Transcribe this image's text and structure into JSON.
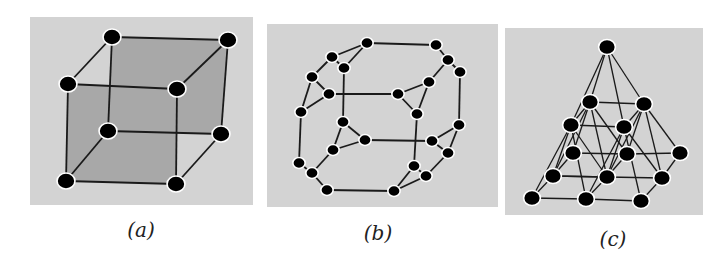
{
  "figure": {
    "panels": [
      {
        "id": "a",
        "label": "(a)",
        "description": "Cube graph (8 vertices, 12 edges)",
        "box": {
          "x": 30,
          "y": 17,
          "w": 223,
          "h": 188
        },
        "label_pos": {
          "x": 141,
          "y": 237
        },
        "nodes": [
          [
            112,
            37
          ],
          [
            228,
            40
          ],
          [
            68,
            84
          ],
          [
            177,
            89
          ],
          [
            108,
            131
          ],
          [
            221,
            134
          ],
          [
            66,
            181
          ],
          [
            176,
            184
          ]
        ],
        "edges": [
          [
            0,
            1
          ],
          [
            0,
            2
          ],
          [
            1,
            3
          ],
          [
            2,
            3
          ],
          [
            0,
            4
          ],
          [
            1,
            5
          ],
          [
            4,
            5
          ],
          [
            2,
            6
          ],
          [
            3,
            7
          ],
          [
            6,
            7
          ],
          [
            4,
            6
          ],
          [
            5,
            7
          ]
        ],
        "shaded_faces": [
          [
            0,
            1,
            5,
            4
          ],
          [
            2,
            3,
            7,
            6
          ]
        ]
      },
      {
        "id": "b",
        "label": "(b)",
        "description": "Truncated cube graph (24 vertices)",
        "box": {
          "x": 267,
          "y": 24,
          "w": 231,
          "h": 183
        },
        "label_pos": {
          "x": 378,
          "y": 240
        },
        "nodes": [
          [
            367,
            43
          ],
          [
            332,
            57
          ],
          [
            344,
            68
          ],
          [
            312,
            77
          ],
          [
            329,
            94
          ],
          [
            301,
            112
          ],
          [
            436,
            45
          ],
          [
            448,
            60
          ],
          [
            460,
            72
          ],
          [
            429,
            82
          ],
          [
            398,
            94
          ],
          [
            417,
            114
          ],
          [
            343,
            122
          ],
          [
            365,
            140
          ],
          [
            333,
            150
          ],
          [
            299,
            163
          ],
          [
            312,
            173
          ],
          [
            327,
            190
          ],
          [
            459,
            125
          ],
          [
            432,
            141
          ],
          [
            448,
            153
          ],
          [
            414,
            166
          ],
          [
            426,
            176
          ],
          [
            394,
            191
          ]
        ],
        "edges": [
          [
            0,
            1
          ],
          [
            1,
            2
          ],
          [
            0,
            2
          ],
          [
            0,
            6
          ],
          [
            1,
            3
          ],
          [
            3,
            4
          ],
          [
            3,
            5
          ],
          [
            4,
            5
          ],
          [
            2,
            12
          ],
          [
            4,
            10
          ],
          [
            6,
            7
          ],
          [
            7,
            8
          ],
          [
            7,
            9
          ],
          [
            9,
            10
          ],
          [
            9,
            11
          ],
          [
            10,
            11
          ],
          [
            8,
            18
          ],
          [
            11,
            21
          ],
          [
            5,
            15
          ],
          [
            12,
            13
          ],
          [
            12,
            14
          ],
          [
            13,
            14
          ],
          [
            13,
            19
          ],
          [
            14,
            16
          ],
          [
            15,
            16
          ],
          [
            16,
            17
          ],
          [
            17,
            23
          ],
          [
            18,
            19
          ],
          [
            18,
            20
          ],
          [
            19,
            20
          ],
          [
            20,
            22
          ],
          [
            21,
            22
          ],
          [
            21,
            23
          ],
          [
            22,
            23
          ]
        ]
      },
      {
        "id": "c",
        "label": "(c)",
        "description": "Subdivided square pyramid (14 vertices)",
        "box": {
          "x": 505,
          "y": 28,
          "w": 198,
          "h": 187
        },
        "label_pos": {
          "x": 613,
          "y": 246
        },
        "nodes": [
          [
            607,
            47
          ],
          [
            590,
            102
          ],
          [
            644,
            104
          ],
          [
            571,
            125
          ],
          [
            624,
            127
          ],
          [
            573,
            153
          ],
          [
            627,
            154
          ],
          [
            680,
            153
          ],
          [
            553,
            176
          ],
          [
            607,
            177
          ],
          [
            662,
            178
          ],
          [
            532,
            198
          ],
          [
            586,
            199
          ],
          [
            641,
            201
          ]
        ],
        "edges": [
          [
            0,
            1
          ],
          [
            0,
            2
          ],
          [
            0,
            3
          ],
          [
            0,
            4
          ],
          [
            1,
            2
          ],
          [
            2,
            4
          ],
          [
            4,
            3
          ],
          [
            3,
            1
          ],
          [
            3,
            11
          ],
          [
            3,
            12
          ],
          [
            3,
            9
          ],
          [
            3,
            8
          ],
          [
            11,
            12
          ],
          [
            12,
            9
          ],
          [
            9,
            8
          ],
          [
            8,
            11
          ],
          [
            1,
            8
          ],
          [
            1,
            9
          ],
          [
            1,
            5
          ],
          [
            1,
            6
          ],
          [
            5,
            6
          ],
          [
            6,
            9
          ],
          [
            9,
            8
          ],
          [
            8,
            5
          ],
          [
            4,
            12
          ],
          [
            4,
            13
          ],
          [
            4,
            10
          ],
          [
            4,
            9
          ],
          [
            12,
            13
          ],
          [
            13,
            10
          ],
          [
            10,
            9
          ],
          [
            2,
            9
          ],
          [
            2,
            10
          ],
          [
            2,
            7
          ],
          [
            2,
            6
          ],
          [
            6,
            7
          ],
          [
            7,
            10
          ]
        ]
      }
    ],
    "colors": {
      "panel_bg": "#d3d3d3",
      "face_fill": "#a8a8a8",
      "edge": "#1a1a1a",
      "node": "#000000",
      "node_outline": "#ffffff"
    }
  }
}
